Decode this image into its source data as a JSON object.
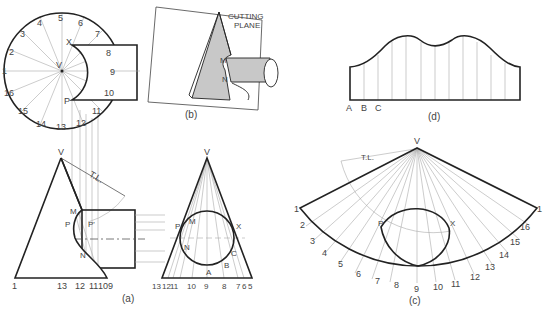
{
  "figure": {
    "views": {
      "top": {
        "circle_labels": [
          "1",
          "2",
          "3",
          "4",
          "5",
          "6",
          "7",
          "8",
          "9",
          "10",
          "11",
          "12",
          "13",
          "14",
          "15",
          "16"
        ],
        "points": {
          "x": "X",
          "v": "V",
          "p": "P"
        }
      },
      "front": {
        "caption": "(a)",
        "apex": "V",
        "true_length": "T.L.",
        "points": {
          "m": "M",
          "p": "P",
          "p_prime": "P'",
          "n": "N"
        },
        "base_labels": [
          "1",
          "13",
          "12",
          "11",
          "10",
          "9"
        ]
      },
      "side": {
        "apex": "V",
        "points": {
          "p": "P",
          "m": "M",
          "x": "X",
          "n": "N",
          "c": "C",
          "b": "B",
          "a": "A"
        },
        "base_labels": [
          "13",
          "12",
          "11",
          "10",
          "9",
          "8",
          "7",
          "6",
          "5"
        ]
      },
      "pictorial": {
        "caption": "(b)",
        "cutting_plane": "CUTTING PLANE",
        "points": {
          "m": "M",
          "n": "N"
        }
      },
      "cone_development": {
        "caption": "(c)",
        "apex": "V",
        "true_length": "T.L.",
        "left_labels": [
          "1",
          "2",
          "3",
          "4",
          "5",
          "6",
          "7",
          "8"
        ],
        "bottom_labels": [
          "9",
          "10",
          "11",
          "12",
          "13",
          "14",
          "15",
          "16",
          "1"
        ],
        "points": {
          "p": "P",
          "x": "X"
        }
      },
      "cylinder_development": {
        "caption": "(d)",
        "labels": [
          "A",
          "B",
          "C"
        ]
      }
    },
    "colors": {
      "ink": "#222222",
      "construction": "#aaaaaa",
      "shade": "#c8c8c8",
      "label": "#444444"
    }
  }
}
